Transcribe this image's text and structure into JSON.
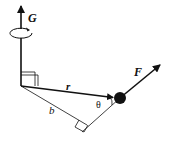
{
  "diagram": {
    "labels": {
      "rotation_axis": "G",
      "force": "F",
      "radius": "r",
      "lever_arm": "b",
      "angle": "θ"
    },
    "colors": {
      "stroke": "#111111",
      "background": "#ffffff"
    }
  }
}
